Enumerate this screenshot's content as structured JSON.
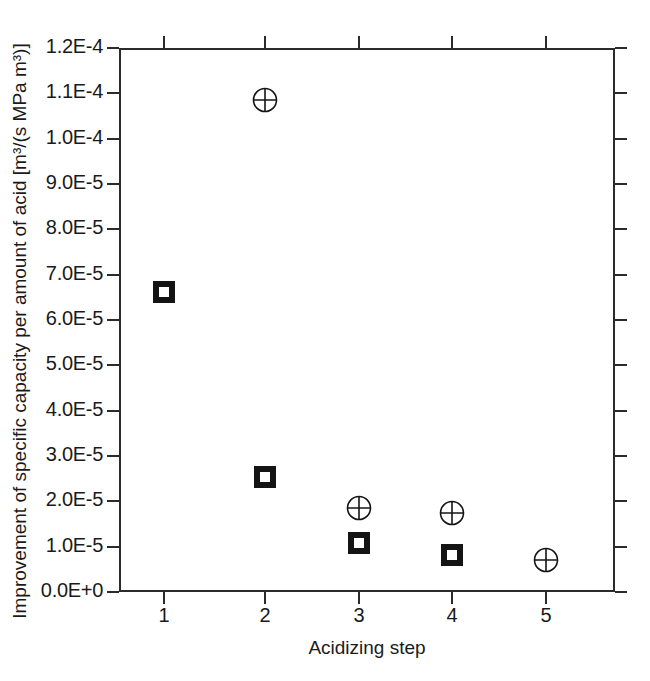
{
  "figure": {
    "background_color": "#ffffff",
    "axis_color": "#2b2b2b",
    "marker_color": "#141414"
  },
  "axes": {
    "xlabel": "Acidizing step",
    "ylabel": "Improvement of specific capacity per amount of acid [m³/(s MPa m³)]",
    "x_ticks": [
      "1",
      "2",
      "3",
      "4",
      "5"
    ],
    "y_ticks": [
      "1.2E-4",
      "1.1E-4",
      "1.0E-4",
      "9.0E-5",
      "8.0E-5",
      "7.0E-5",
      "6.0E-5",
      "5.0E-5",
      "4.0E-5",
      "3.0E-5",
      "2.0E-5",
      "1.0E-5",
      "0.0E+0"
    ]
  },
  "chart_data": {
    "type": "scatter",
    "title": "",
    "xlabel": "Acidizing step",
    "ylabel": "Improvement of specific capacity per amount of acid [m³/(s MPa m³)]",
    "xlim": [
      0.6,
      5.45
    ],
    "ylim": [
      0.0,
      0.00012
    ],
    "y_tick_values": [
      0.00012,
      0.00011,
      0.0001,
      9e-05,
      8e-05,
      7e-05,
      6e-05,
      5e-05,
      4e-05,
      3e-05,
      2e-05,
      1e-05,
      0.0
    ],
    "y_tick_labels": [
      "1.2E-4",
      "1.1E-4",
      "1.0E-4",
      "9.0E-5",
      "8.0E-5",
      "7.0E-5",
      "6.0E-5",
      "5.0E-5",
      "4.0E-5",
      "3.0E-5",
      "2.0E-5",
      "1.0E-5",
      "0.0E+0"
    ],
    "x_tick_values": [
      1,
      2,
      3,
      4,
      5
    ],
    "x_tick_labels": [
      "1",
      "2",
      "3",
      "4",
      "5"
    ],
    "grid": false,
    "legend": "none",
    "series": [
      {
        "name": "open-square",
        "marker": "square",
        "x": [
          1,
          2,
          3,
          4
        ],
        "y": [
          6.62e-05,
          2.54e-05,
          1.08e-05,
          8.2e-06
        ]
      },
      {
        "name": "circle-plus",
        "marker": "circle-with-cross",
        "x": [
          2,
          3,
          4,
          5
        ],
        "y": [
          0.0001085,
          1.85e-05,
          1.74e-05,
          7.1e-06
        ]
      }
    ]
  },
  "points": [
    {
      "marker": "square",
      "left": 172,
      "top": 291
    },
    {
      "marker": "square",
      "left": 265,
      "top": 477
    },
    {
      "marker": "square",
      "left": 359,
      "top": 543
    },
    {
      "marker": "square",
      "left": 452,
      "top": 555
    },
    {
      "marker": "circle",
      "left": 265,
      "top": 100
    },
    {
      "marker": "circle",
      "left": 359,
      "top": 508
    },
    {
      "marker": "circle",
      "left": 452,
      "top": 513
    },
    {
      "marker": "circle",
      "left": 546,
      "top": 560
    }
  ]
}
